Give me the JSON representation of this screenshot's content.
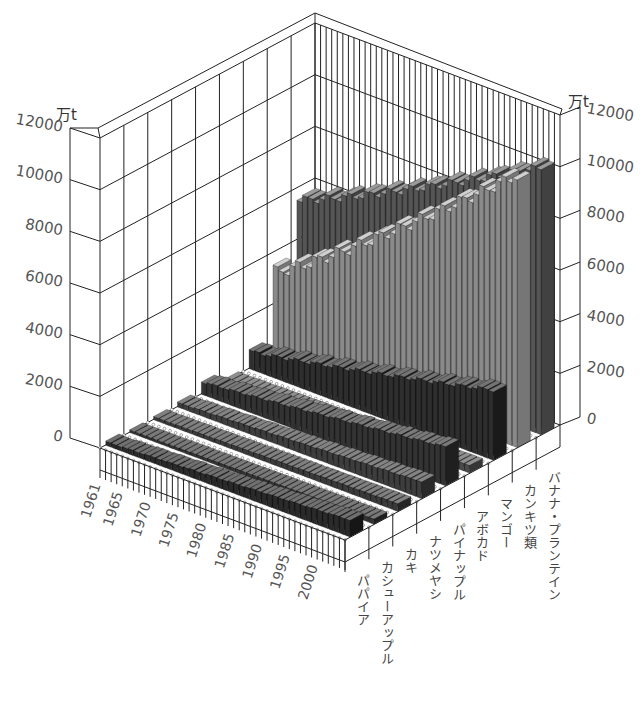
{
  "chart_data": {
    "type": "bar",
    "style": "3d-grouped-bar",
    "unit": "万t",
    "title": "",
    "xlabel": "",
    "ylabel": "万t",
    "ylim": [
      0,
      12000
    ],
    "yticks": [
      0,
      2000,
      4000,
      6000,
      8000,
      10000,
      12000
    ],
    "year_ticks": [
      "1961",
      "1965",
      "1970",
      "1975",
      "1980",
      "1985",
      "1990",
      "1995",
      "2000"
    ],
    "years": [
      1961,
      1962,
      1963,
      1964,
      1965,
      1966,
      1967,
      1968,
      1969,
      1970,
      1971,
      1972,
      1973,
      1974,
      1975,
      1976,
      1977,
      1978,
      1979,
      1980,
      1981,
      1982,
      1983,
      1984,
      1985,
      1986,
      1987,
      1988,
      1989,
      1990,
      1991,
      1992,
      1993,
      1994,
      1995,
      1996,
      1997,
      1998,
      1999,
      2000,
      2001,
      2002,
      2003,
      2004
    ],
    "categories": [
      "パパイア",
      "カシューアップル",
      "カキ",
      "ナツメヤシ",
      "パイナップル",
      "アボカド",
      "マンゴー",
      "カンキツ類",
      "バナナ・プランテイン"
    ],
    "series": [
      {
        "name": "パパイア",
        "start": 150,
        "end": 650,
        "color": "#2a2a2a"
      },
      {
        "name": "カシューアップル",
        "start": 100,
        "end": 200,
        "color": "#333333"
      },
      {
        "name": "カキ",
        "start": 120,
        "end": 300,
        "color": "#3a3a3a"
      },
      {
        "name": "ナツメヤシ",
        "start": 180,
        "end": 650,
        "color": "#3d3d3d"
      },
      {
        "name": "パイナップル",
        "start": 500,
        "end": 1500,
        "color": "#333333"
      },
      {
        "name": "アボカド",
        "start": 100,
        "end": 300,
        "color": "#4a4a4a"
      },
      {
        "name": "マンゴー",
        "start": 700,
        "end": 2700,
        "color": "#2e2e2e"
      },
      {
        "name": "カンキツ類",
        "start": 3300,
        "end": 10500,
        "color": "#8a8a8a"
      },
      {
        "name": "バナナ・プランテイン",
        "start": 5600,
        "end": 10300,
        "color": "#555555"
      }
    ]
  },
  "axes": {
    "left_unit": "万t",
    "right_unit": "万t",
    "left_ticks": [
      "12000",
      "10000",
      "8000",
      "6000",
      "4000",
      "2000",
      "0"
    ],
    "right_ticks": [
      "12000",
      "10000",
      "8000",
      "6000",
      "4000",
      "2000",
      "0"
    ]
  }
}
